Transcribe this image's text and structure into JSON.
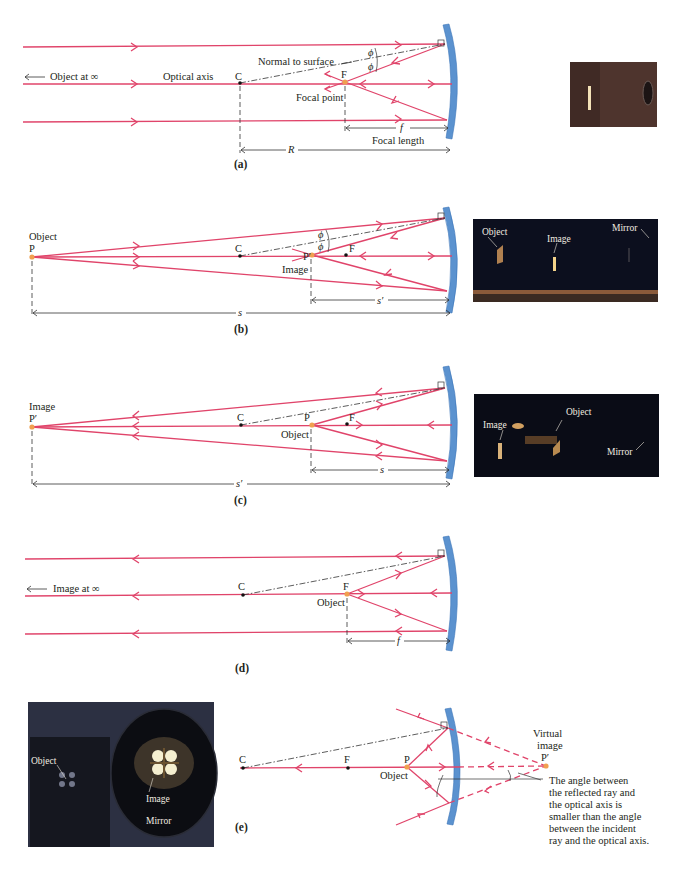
{
  "figure": {
    "panels": [
      {
        "id": "a",
        "caption": "(a)",
        "labels": {
          "object_at_infinity": "Object at ∞",
          "optical_axis": "Optical axis",
          "center": "C",
          "focal": "F",
          "normal": "Normal to surface",
          "focal_point": "Focal point",
          "phi": "ϕ",
          "f": "f",
          "focal_length": "Focal length",
          "R": "R"
        },
        "photo": {
          "description": "dim photo of light beam and concave mirror",
          "colors": [
            "#5a3a30",
            "#3a2520"
          ]
        }
      },
      {
        "id": "b",
        "caption": "(b)",
        "labels": {
          "object": "Object",
          "P": "P",
          "center": "C",
          "P_prime": "P′",
          "image": "Image",
          "focal": "F",
          "phi": "ϕ",
          "s_prime": "s′",
          "s": "s"
        },
        "photo": {
          "labels": [
            "Object",
            "Image",
            "Mirror"
          ]
        }
      },
      {
        "id": "c",
        "caption": "(c)",
        "labels": {
          "image": "Image",
          "P_prime": "P′",
          "center": "C",
          "P": "P",
          "object": "Object",
          "focal": "F",
          "s": "s",
          "s_prime": "s′"
        },
        "photo": {
          "labels": [
            "Object",
            "Image",
            "Mirror"
          ]
        }
      },
      {
        "id": "d",
        "caption": "(d)",
        "labels": {
          "image_at_infinity": "Image at ∞",
          "center": "C",
          "focal": "F",
          "object": "Object",
          "f": "f"
        }
      },
      {
        "id": "e",
        "caption": "(e)",
        "labels": {
          "center": "C",
          "focal": "F",
          "P": "P",
          "object": "Object",
          "virtual_image_1": "Virtual",
          "virtual_image_2": "image",
          "P_prime": "P′",
          "note_lines": [
            "The angle between",
            "the reflected ray and",
            "the optical axis is",
            "smaller than the angle",
            "between  the incident",
            "ray and the optical axis."
          ]
        },
        "photo": {
          "labels": [
            "Object",
            "Image",
            "Mirror"
          ]
        }
      }
    ],
    "colors": {
      "ray": "#e0446a",
      "mirror": "#5b92cf",
      "point": "#f0a050",
      "text": "#231f20"
    }
  }
}
